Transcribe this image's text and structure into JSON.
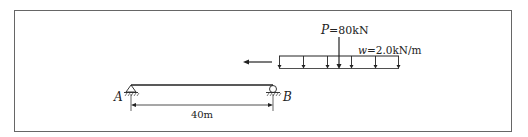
{
  "diagram": {
    "type": "structural-beam-moving-load",
    "colors": {
      "frame": "#555555",
      "ink": "#222222",
      "background": "#ffffff"
    },
    "beam": {
      "span_label": "40m",
      "support_left": {
        "label": "A",
        "type": "pin"
      },
      "support_right": {
        "label": "B",
        "type": "roller"
      }
    },
    "loads": {
      "point_load": {
        "symbol": "P",
        "value_text": "=80kN"
      },
      "distributed_load": {
        "symbol": "w",
        "value_text": "=2.0kN/m"
      },
      "motion_direction": "left"
    }
  }
}
